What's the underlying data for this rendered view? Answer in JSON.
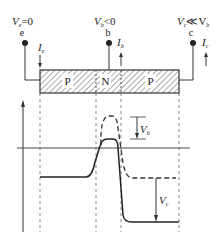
{
  "diagram": {
    "type": "pnp-transistor-potential-diagram",
    "terminals": [
      {
        "id": "e",
        "label": "e",
        "voltage_main": "V",
        "voltage_sub": "e",
        "voltage_rel": "=0",
        "current_main": "I",
        "current_sub": "e",
        "current_dir": "down"
      },
      {
        "id": "b",
        "label": "b",
        "voltage_main": "V",
        "voltage_sub": "b",
        "voltage_rel": "<0",
        "current_main": "I",
        "current_sub": "b",
        "current_dir": "up"
      },
      {
        "id": "c",
        "label": "c",
        "voltage_main": "V",
        "voltage_sub": "c",
        "voltage_rel": "≪V",
        "voltage_rel_sub": "b",
        "current_main": "I",
        "current_sub": "c",
        "current_dir": "up"
      }
    ],
    "regions": [
      "P",
      "N",
      "P"
    ],
    "annotations": {
      "vb": {
        "main": "V",
        "sub": "b"
      },
      "vc": {
        "main": "V",
        "sub": "c"
      }
    },
    "curves": [
      {
        "name": "equilibrium",
        "style": "dashed"
      },
      {
        "name": "biased",
        "style": "solid"
      }
    ],
    "colors": {
      "line": "#333333",
      "hatch": "#555555"
    }
  }
}
